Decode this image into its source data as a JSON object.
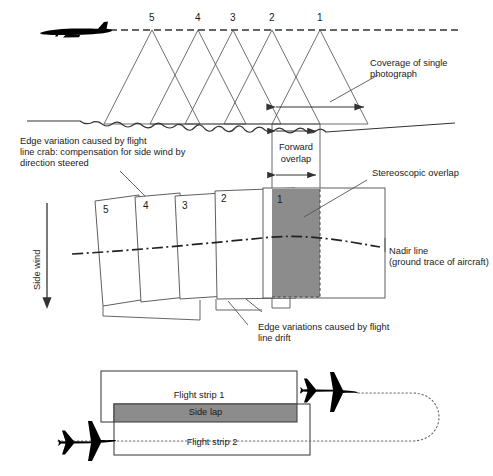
{
  "diagram": {
    "colors": {
      "stroke": "#333333",
      "shade_gray": "#8c8c8c",
      "aircraft_black": "#000000",
      "background": "#ffffff"
    },
    "panel_top": {
      "name": "forward-overlap-profile",
      "photo_numbers": [
        "5",
        "4",
        "3",
        "2",
        "1"
      ],
      "callout_coverage": "Coverage of single\nphotograph",
      "flight_line_style": "dashed",
      "ground_style": "wavy-terrain",
      "aircraft_view": "side-profile"
    },
    "panel_middle": {
      "name": "photo-frame-plan-view",
      "frame_numbers": [
        "5",
        "4",
        "3",
        "2",
        "1"
      ],
      "callout_crab": "Edge variation caused by flight\nline crab: compensation for side wind by\ndirection steered",
      "callout_forward_overlap": "Forward\noverlap",
      "callout_stereoscopic": "Stereoscopic overlap",
      "callout_nadir": "Nadir line\n(ground trace of aircraft)",
      "callout_drift": "Edge variations caused by flight\nline drift",
      "side_wind_label": "Side wind",
      "nadir_line_style": "dash-dot"
    },
    "panel_bottom": {
      "name": "side-lap-strips",
      "strip1_label": "Flight strip 1",
      "strip2_label": "Flight strip 2",
      "sidelap_label": "Side lap",
      "flight_path_style": "dotted-u-turn",
      "aircraft_view": "plan-top-down"
    }
  }
}
